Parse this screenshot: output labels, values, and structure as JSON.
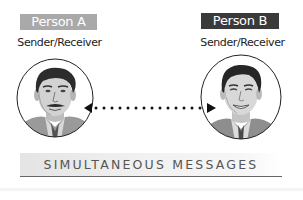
{
  "diagram": {
    "title": "SIMULTANEOUS MESSAGES",
    "participants": [
      {
        "name": "Person A",
        "role": "Sender/Receiver",
        "label_bg": "#a9a9a9",
        "portrait": "man-with-mustache-portrait"
      },
      {
        "name": "Person B",
        "role": "Sender/Receiver",
        "label_bg": "#3a3a3a",
        "portrait": "smiling-man-portrait"
      }
    ],
    "connector": {
      "style": "dotted",
      "direction": "bidirectional",
      "color": "#111111"
    },
    "banner": {
      "underline_color": "#666666"
    }
  }
}
